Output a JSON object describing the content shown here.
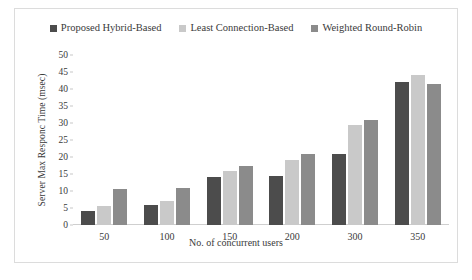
{
  "chart_data": {
    "type": "bar",
    "title": "",
    "xlabel": "No. of concurrent users",
    "ylabel": "Server Max Responc Time (msec)",
    "categories": [
      "50",
      "100",
      "150",
      "200",
      "300",
      "350"
    ],
    "series": [
      {
        "name": "Proposed Hybrid-Based",
        "color": "#4c4c4c",
        "values": [
          4,
          6,
          14,
          14.5,
          21,
          42
        ]
      },
      {
        "name": "Least Connection-Based",
        "color": "#c9c9c9",
        "values": [
          5.5,
          7,
          16,
          19,
          29.5,
          44
        ]
      },
      {
        "name": "Weighted  Round-Robin",
        "color": "#8b8b8b",
        "values": [
          10.5,
          11,
          17.5,
          21,
          31,
          41.5
        ]
      }
    ],
    "ylim": [
      0,
      50
    ],
    "ytick_step": 5,
    "yticks": [
      "50",
      "45",
      "40",
      "35",
      "30",
      "25",
      "20",
      "15",
      "10",
      "5",
      "0"
    ],
    "grid": false,
    "legend_position": "top-center"
  }
}
